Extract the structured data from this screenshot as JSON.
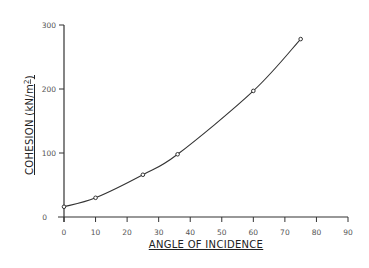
{
  "chart_data": {
    "type": "line",
    "title": "",
    "xlabel": "ANGLE OF INCIDENCE",
    "ylabel": "COHESION (kN/m2)",
    "xlim": [
      0,
      90
    ],
    "ylim": [
      0,
      300
    ],
    "x_ticks": [
      0,
      10,
      20,
      30,
      40,
      50,
      60,
      70,
      80,
      90
    ],
    "y_ticks": [
      0,
      100,
      200,
      300
    ],
    "grid": false,
    "legend": null,
    "series": [
      {
        "name": "Cohesion",
        "x": [
          0,
          10,
          25,
          36,
          60,
          75
        ],
        "values": [
          16,
          30,
          66,
          98,
          197,
          278
        ],
        "markers": true,
        "smooth": true
      }
    ]
  },
  "labels": {
    "xlabel": "ANGLE OF INCIDENCE",
    "ylabel": "COHESION (kN/m2)"
  }
}
